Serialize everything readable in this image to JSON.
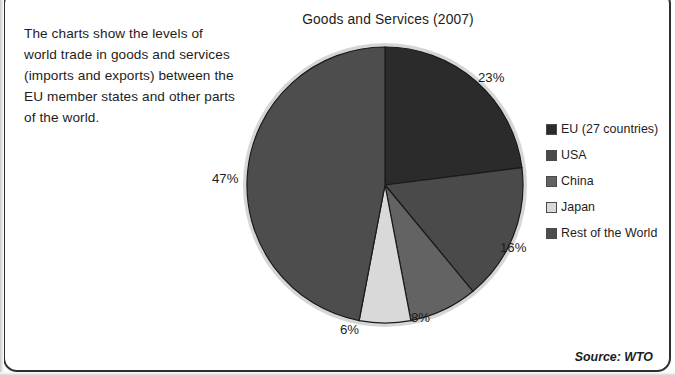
{
  "intro": {
    "text": "The charts show the levels of world trade in goods and services (imports and exports) between the EU member states and other parts of the world."
  },
  "chart": {
    "title": "Goods and Services (2007)"
  },
  "source": {
    "text": "Source: WTO"
  },
  "legend": {
    "items": [
      {
        "label": "EU (27 countries)",
        "color": "#2b2b2b"
      },
      {
        "label": "USA",
        "color": "#4a4a4a"
      },
      {
        "label": "China",
        "color": "#636363"
      },
      {
        "label": "Japan",
        "color": "#d9d9d9"
      },
      {
        "label": "Rest of the World",
        "color": "#4d4d4d"
      }
    ]
  },
  "labels": {
    "eu": "23%",
    "usa": "16%",
    "china": "8%",
    "japan": "6%",
    "row": "47%"
  },
  "chart_data": {
    "type": "pie",
    "title": "Goods and Services (2007)",
    "xlabel": "",
    "ylabel": "",
    "categories": [
      "EU (27 countries)",
      "USA",
      "China",
      "Japan",
      "Rest of the World"
    ],
    "values": [
      23,
      16,
      8,
      6,
      47
    ],
    "value_labels": [
      "23%",
      "16%",
      "8%",
      "6%",
      "47%"
    ],
    "colors": [
      "#2b2b2b",
      "#4a4a4a",
      "#636363",
      "#d9d9d9",
      "#4d4d4d"
    ],
    "legend_position": "right",
    "grid": false,
    "start_angle_deg": 0,
    "direction": "clockwise",
    "units": "percent",
    "source": "Source: WTO"
  }
}
